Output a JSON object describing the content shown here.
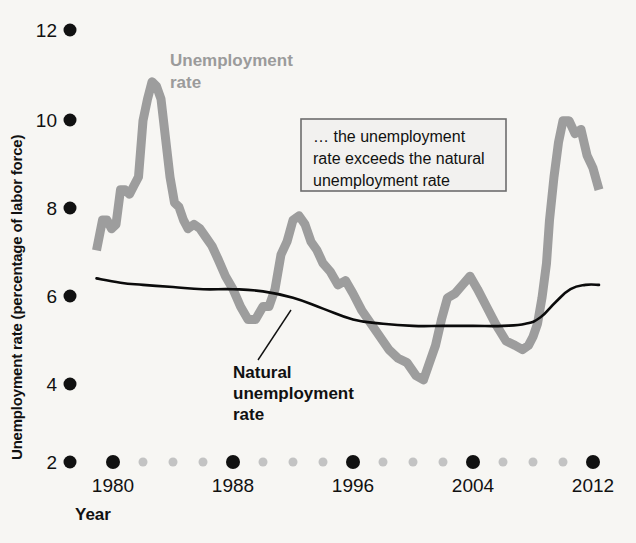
{
  "figure": {
    "background": "#f7f6f3",
    "axis_title_y": "Unemployment rate (percentage of labor force)",
    "axis_title_x": "Year"
  },
  "labels": {
    "unemployment_series": "Unemployment\nrate",
    "unemployment_series_line1": "Unemployment",
    "unemployment_series_line2": "rate",
    "natural_series_line1": "Natural",
    "natural_series_line2": "unemployment",
    "natural_series_line3": "rate",
    "callout_line1": "… the unemployment",
    "callout_line2": "rate exceeds the natural",
    "callout_line3": "unemployment rate"
  },
  "colors": {
    "unemployment_rate": "#9d9d9d",
    "natural_rate": "#0b0b0b",
    "major_tick_dot": "#111111",
    "minor_tick_dot": "#c3c3c3",
    "callout_fill": "#f2f1ef",
    "callout_border": "#6d6d6d"
  },
  "chart_data": {
    "type": "line",
    "title": "",
    "xlabel": "Year",
    "ylabel": "Unemployment rate (percentage of labor force)",
    "xlim": [
      1978,
      2013
    ],
    "ylim": [
      2,
      12
    ],
    "yticks": [
      2,
      4,
      6,
      8,
      10,
      12
    ],
    "ytick_labels": [
      "2",
      "4",
      "6",
      "8",
      "10",
      "12"
    ],
    "xticks_major": [
      1980,
      1988,
      1996,
      2004,
      2012
    ],
    "xtick_labels": [
      "1980",
      "1988",
      "1996",
      "2004",
      "2012"
    ],
    "xticks_minor": [
      1982,
      1984,
      1986,
      1990,
      1992,
      1994,
      1998,
      2000,
      2002,
      2006,
      2008,
      2010
    ],
    "grid": false,
    "legend_position": "inline-annotations",
    "annotations": [
      {
        "text": "… the unemployment rate exceeds the natural unemployment rate",
        "x": 1993.5,
        "y": 9.0,
        "style": "boxed"
      },
      {
        "text": "Unemployment rate",
        "x": 1985.5,
        "y": 11.3,
        "style": "series-label-gray"
      },
      {
        "text": "Natural unemployment rate",
        "x": 1993.0,
        "y": 4.3,
        "style": "series-label-black",
        "leader_to": {
          "x": 1992.7,
          "y": 5.75
        }
      }
    ],
    "series": [
      {
        "name": "Unemployment rate",
        "color": "#9d9d9d",
        "x": [
          1978.9,
          1979.3,
          1979.6,
          1979.9,
          1980.2,
          1980.5,
          1980.8,
          1981.1,
          1981.4,
          1981.7,
          1982.0,
          1982.3,
          1982.6,
          1982.9,
          1983.2,
          1983.5,
          1983.8,
          1984.1,
          1984.4,
          1984.7,
          1985.0,
          1985.4,
          1985.8,
          1986.2,
          1986.6,
          1987.0,
          1987.5,
          1988.0,
          1988.5,
          1989.0,
          1989.5,
          1990.0,
          1990.4,
          1990.8,
          1991.2,
          1991.6,
          1992.0,
          1992.4,
          1992.8,
          1993.2,
          1993.6,
          1994.0,
          1994.5,
          1995.0,
          1995.5,
          1996.0,
          1996.6,
          1997.2,
          1997.8,
          1998.4,
          1999.0,
          1999.6,
          2000.2,
          2000.7,
          2001.1,
          2001.5,
          2001.9,
          2002.3,
          2002.8,
          2003.3,
          2003.8,
          2004.3,
          2004.9,
          2005.5,
          2006.2,
          2006.8,
          2007.3,
          2007.7,
          2008.0,
          2008.3,
          2008.6,
          2008.9,
          2009.1,
          2009.4,
          2009.7,
          2010.0,
          2010.4,
          2010.8,
          2011.2,
          2011.6,
          2012.0,
          2012.4
        ],
        "y": [
          6.9,
          7.6,
          7.6,
          7.4,
          7.5,
          8.3,
          8.3,
          8.2,
          8.4,
          8.6,
          9.9,
          10.4,
          10.8,
          10.7,
          10.4,
          9.5,
          8.6,
          8.0,
          7.9,
          7.6,
          7.4,
          7.5,
          7.4,
          7.2,
          7.0,
          6.7,
          6.3,
          6.0,
          5.6,
          5.3,
          5.3,
          5.6,
          5.6,
          6.0,
          6.8,
          7.1,
          7.6,
          7.7,
          7.5,
          7.1,
          6.9,
          6.6,
          6.4,
          6.1,
          6.2,
          5.9,
          5.5,
          5.2,
          4.9,
          4.6,
          4.4,
          4.3,
          4.0,
          3.9,
          4.3,
          4.7,
          5.3,
          5.8,
          5.9,
          6.1,
          6.3,
          6.0,
          5.6,
          5.2,
          4.8,
          4.7,
          4.6,
          4.7,
          4.9,
          5.2,
          5.8,
          6.6,
          7.6,
          8.6,
          9.4,
          9.9,
          9.9,
          9.6,
          9.7,
          9.1,
          8.8,
          8.3
        ]
      },
      {
        "name": "Natural unemployment rate",
        "color": "#0b0b0b",
        "x": [
          1978.9,
          1980.5,
          1982.0,
          1984.0,
          1986.0,
          1988.0,
          1990.0,
          1992.0,
          1994.0,
          1996.0,
          1998.0,
          2000.0,
          2002.0,
          2004.0,
          2006.0,
          2007.5,
          2008.5,
          2009.5,
          2010.5,
          2011.5,
          2012.4
        ],
        "y": [
          6.25,
          6.15,
          6.1,
          6.05,
          6.0,
          6.0,
          5.95,
          5.8,
          5.55,
          5.3,
          5.2,
          5.15,
          5.15,
          5.15,
          5.15,
          5.2,
          5.35,
          5.7,
          6.0,
          6.1,
          6.1
        ]
      }
    ]
  }
}
